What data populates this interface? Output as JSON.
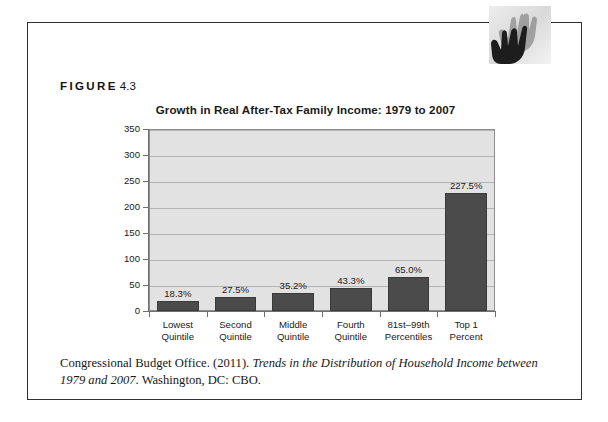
{
  "figure": {
    "label_word": "FIGURE",
    "label_number": "4.3"
  },
  "logo": {
    "icon": "hands-icon"
  },
  "citation": {
    "part1": "Congressional Budget Office. (2011). ",
    "italic1": "Trends in the Distribution of Household Income between 1979 and 2007",
    "part2": ". Washington, DC: CBO."
  },
  "chart_data": {
    "type": "bar",
    "title": "Growth in Real After-Tax Family Income: 1979 to 2007",
    "xlabel": "",
    "ylabel": "",
    "ylim": [
      0,
      350
    ],
    "yticks": [
      0,
      50,
      100,
      150,
      200,
      250,
      300,
      350
    ],
    "ytick_labels": [
      "0",
      "50",
      "100",
      "150",
      "200",
      "250",
      "300",
      "350"
    ],
    "grid": true,
    "legend": "none",
    "categories": [
      "Lowest Quintile",
      "Second Quintile",
      "Middle Quintile",
      "Fourth Quintile",
      "81st–99th Percentiles",
      "Top 1 Percent"
    ],
    "category_lines": [
      [
        "Lowest",
        "Quintile"
      ],
      [
        "Second",
        "Quintile"
      ],
      [
        "Middle",
        "Quintile"
      ],
      [
        "Fourth",
        "Quintile"
      ],
      [
        "81st–99th",
        "Percentiles"
      ],
      [
        "Top 1",
        "Percent"
      ]
    ],
    "values": [
      18.3,
      27.5,
      35.2,
      43.3,
      65.0,
      227.5
    ],
    "data_labels": [
      "18.3%",
      "27.5%",
      "35.2%",
      "43.3%",
      "65.0%",
      "227.5%"
    ],
    "bar_color": "#4b4b4b",
    "plot_background": "#e2e2e2",
    "grid_color": "#b4b4b4",
    "axis_color": "#6f6f6f"
  }
}
